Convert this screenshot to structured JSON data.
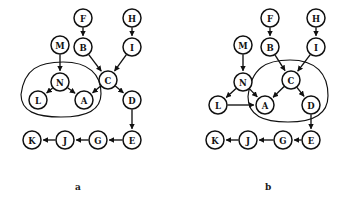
{
  "figure": {
    "panels": [
      {
        "id": "a",
        "label": "a",
        "nodes": [
          {
            "id": "F",
            "label": "F",
            "x": 83,
            "y": 18,
            "r": 9
          },
          {
            "id": "H",
            "label": "H",
            "x": 132,
            "y": 18,
            "r": 9
          },
          {
            "id": "M",
            "label": "M",
            "x": 60,
            "y": 45,
            "r": 9
          },
          {
            "id": "B",
            "label": "B",
            "x": 83,
            "y": 47,
            "r": 9
          },
          {
            "id": "I",
            "label": "I",
            "x": 132,
            "y": 47,
            "r": 9
          },
          {
            "id": "N",
            "label": "N",
            "x": 60,
            "y": 82,
            "r": 9
          },
          {
            "id": "C",
            "label": "C",
            "x": 108,
            "y": 80,
            "r": 9
          },
          {
            "id": "L",
            "label": "L",
            "x": 38,
            "y": 100,
            "r": 9
          },
          {
            "id": "A",
            "label": "A",
            "x": 84,
            "y": 100,
            "r": 9
          },
          {
            "id": "D",
            "label": "D",
            "x": 132,
            "y": 100,
            "r": 9
          },
          {
            "id": "K",
            "label": "K",
            "x": 32,
            "y": 140,
            "r": 9
          },
          {
            "id": "J",
            "label": "J",
            "x": 65,
            "y": 140,
            "r": 9
          },
          {
            "id": "G",
            "label": "G",
            "x": 98,
            "y": 140,
            "r": 9
          },
          {
            "id": "E",
            "label": "E",
            "x": 132,
            "y": 140,
            "r": 9
          }
        ],
        "edges": [
          {
            "from": "F",
            "to": "B"
          },
          {
            "from": "H",
            "to": "I"
          },
          {
            "from": "M",
            "to": "N"
          },
          {
            "from": "B",
            "to": "C"
          },
          {
            "from": "I",
            "to": "C"
          },
          {
            "from": "N",
            "to": "L"
          },
          {
            "from": "N",
            "to": "A"
          },
          {
            "from": "C",
            "to": "A"
          },
          {
            "from": "C",
            "to": "D"
          },
          {
            "from": "D",
            "to": "E"
          },
          {
            "from": "E",
            "to": "G"
          },
          {
            "from": "G",
            "to": "J"
          },
          {
            "from": "J",
            "to": "K"
          }
        ],
        "enclosure": {
          "members": [
            "N",
            "L",
            "A"
          ]
        }
      },
      {
        "id": "b",
        "label": "b",
        "nodes": [
          {
            "id": "F",
            "label": "F",
            "x": 270,
            "y": 18,
            "r": 9
          },
          {
            "id": "H",
            "label": "H",
            "x": 316,
            "y": 18,
            "r": 9
          },
          {
            "id": "M",
            "label": "M",
            "x": 243,
            "y": 45,
            "r": 9
          },
          {
            "id": "B",
            "label": "B",
            "x": 270,
            "y": 47,
            "r": 9
          },
          {
            "id": "I",
            "label": "I",
            "x": 316,
            "y": 47,
            "r": 9
          },
          {
            "id": "N",
            "label": "N",
            "x": 243,
            "y": 82,
            "r": 9
          },
          {
            "id": "C",
            "label": "C",
            "x": 291,
            "y": 80,
            "r": 9
          },
          {
            "id": "L",
            "label": "L",
            "x": 218,
            "y": 105,
            "r": 9
          },
          {
            "id": "A",
            "label": "A",
            "x": 265,
            "y": 105,
            "r": 9
          },
          {
            "id": "D",
            "label": "D",
            "x": 311,
            "y": 105,
            "r": 9
          },
          {
            "id": "K",
            "label": "K",
            "x": 215,
            "y": 140,
            "r": 9
          },
          {
            "id": "J",
            "label": "J",
            "x": 248,
            "y": 140,
            "r": 9
          },
          {
            "id": "G",
            "label": "G",
            "x": 283,
            "y": 140,
            "r": 9
          },
          {
            "id": "E",
            "label": "E",
            "x": 311,
            "y": 140,
            "r": 9
          }
        ],
        "edges": [
          {
            "from": "F",
            "to": "B"
          },
          {
            "from": "H",
            "to": "I"
          },
          {
            "from": "M",
            "to": "N"
          },
          {
            "from": "B",
            "to": "C"
          },
          {
            "from": "I",
            "to": "C"
          },
          {
            "from": "N",
            "to": "L"
          },
          {
            "from": "N",
            "to": "A"
          },
          {
            "from": "C",
            "to": "A"
          },
          {
            "from": "C",
            "to": "D"
          },
          {
            "from": "L",
            "to": "A"
          },
          {
            "from": "D",
            "to": "E"
          },
          {
            "from": "E",
            "to": "G"
          },
          {
            "from": "G",
            "to": "J"
          },
          {
            "from": "J",
            "to": "K"
          }
        ],
        "enclosure": {
          "members": [
            "C",
            "A",
            "D"
          ]
        }
      }
    ]
  },
  "style": {
    "node_fill": "#ffffff",
    "node_stroke": "#111111",
    "edge_stroke": "#111111",
    "enclosure_stroke": "#111111",
    "background": "#ffffff"
  }
}
